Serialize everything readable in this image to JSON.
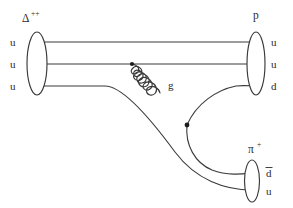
{
  "diagram": {
    "background_color": "#ffffff",
    "line_color": "#3a3a3a",
    "text_color": "#2b2b2b",
    "initial_state": {
      "particle_label": "Δ",
      "particle_charge": "++",
      "quarks": [
        "u",
        "u",
        "u"
      ]
    },
    "final_state_baryon": {
      "particle_label": "p",
      "quarks": [
        "u",
        "u",
        "d"
      ]
    },
    "final_state_meson": {
      "particle_label": "π",
      "particle_charge": "+",
      "quarks": [
        "d",
        "u"
      ],
      "antiquark_bar_on": "d"
    },
    "mediator": {
      "label": "g",
      "name": "gluon",
      "coils": 7
    },
    "vertices": [
      {
        "name": "gluon-emission-vertex",
        "x": 132,
        "y": 64
      },
      {
        "name": "gluon-absorption-vertex",
        "x": 187,
        "y": 125
      }
    ]
  }
}
